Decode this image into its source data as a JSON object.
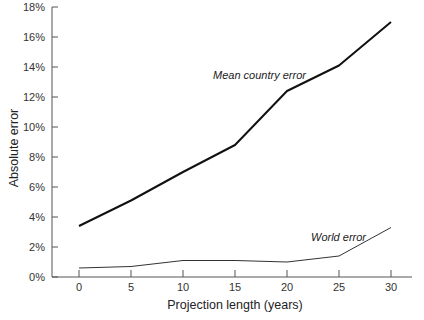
{
  "chart_data": {
    "type": "line",
    "title": "",
    "xlabel": "Projection length (years)",
    "ylabel": "Absolute error",
    "x": [
      0,
      5,
      10,
      15,
      20,
      25,
      30
    ],
    "xticks": [
      "0",
      "5",
      "10",
      "15",
      "20",
      "25",
      "30"
    ],
    "yticks": [
      "0%",
      "2%",
      "4%",
      "6%",
      "8%",
      "10%",
      "12%",
      "14%",
      "16%",
      "18%"
    ],
    "xlim": [
      -3,
      33
    ],
    "ylim": [
      0,
      18
    ],
    "grid": false,
    "legend": "none (inline annotations)",
    "series": [
      {
        "name": "Mean country error",
        "values": [
          3.4,
          5.1,
          7.0,
          8.8,
          12.4,
          14.1,
          17.0
        ],
        "color": "#111111",
        "line_width": 2
      },
      {
        "name": "World error",
        "values": [
          0.6,
          0.7,
          1.1,
          1.1,
          1.0,
          1.4,
          3.3
        ],
        "color": "#333333",
        "line_width": 1
      }
    ],
    "annotations": [
      {
        "text": "Mean country error",
        "near_series": "Mean country error"
      },
      {
        "text": "World error",
        "near_series": "World error"
      }
    ]
  }
}
